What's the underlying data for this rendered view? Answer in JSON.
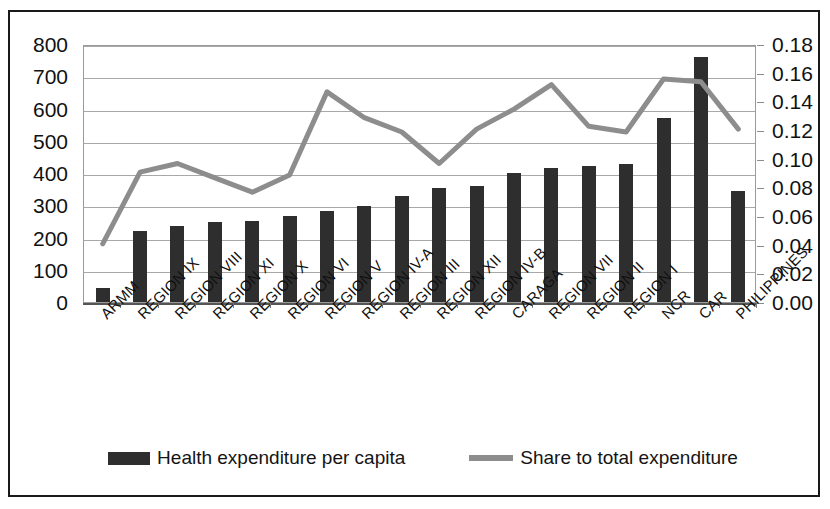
{
  "chart_data": {
    "type": "bar",
    "title": "",
    "subtitle": "",
    "xlabel": "",
    "ylabel": "",
    "categories": [
      "ARMM",
      "REGION IX",
      "REGION VIII",
      "REGION XI",
      "REGION X",
      "REGION VI",
      "REGION V",
      "REGION IV-A",
      "REGION III",
      "REGION XII",
      "REGION IV-B",
      "CARAGA",
      "REGION VII",
      "REGION II",
      "REGION I",
      "NCR",
      "CAR",
      "PHILIPPINES"
    ],
    "series": [
      {
        "name": "Health expenditure per capita",
        "type": "bar",
        "axis": "left",
        "color": "#2e2e2e",
        "values": [
          45,
          220,
          235,
          248,
          250,
          268,
          282,
          297,
          328,
          355,
          360,
          400,
          415,
          422,
          428,
          570,
          760,
          345
        ]
      },
      {
        "name": "Share to total expenditure",
        "type": "line",
        "axis": "right",
        "color": "#8d8d8d",
        "values": [
          0.042,
          0.092,
          0.098,
          0.088,
          0.078,
          0.09,
          0.148,
          0.13,
          0.12,
          0.098,
          0.122,
          0.136,
          0.153,
          0.124,
          0.12,
          0.157,
          0.155,
          0.122
        ]
      }
    ],
    "left_axis": {
      "ticks": [
        0,
        100,
        200,
        300,
        400,
        500,
        600,
        700,
        800
      ],
      "labels": [
        "0",
        "100",
        "200",
        "300",
        "400",
        "500",
        "600",
        "700",
        "800"
      ],
      "min": 0,
      "max": 800
    },
    "right_axis": {
      "ticks": [
        0.0,
        0.02,
        0.04,
        0.06,
        0.08,
        0.1,
        0.12,
        0.14,
        0.16,
        0.18
      ],
      "labels": [
        "0.00",
        "0.02",
        "0.04",
        "0.06",
        "0.08",
        "0.10",
        "0.12",
        "0.14",
        "0.16",
        "0.18"
      ],
      "min": 0,
      "max": 0.18
    },
    "grid": true,
    "legend_position": "bottom",
    "legend": [
      {
        "label": "Health expenditure per capita",
        "marker": "bar",
        "color": "#2e2e2e"
      },
      {
        "label": "Share to total expenditure",
        "marker": "line",
        "color": "#8d8d8d"
      }
    ]
  }
}
